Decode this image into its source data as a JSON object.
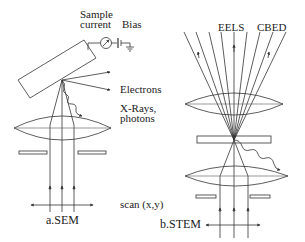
{
  "diagram": {
    "panels": [
      {
        "id": "sem",
        "caption": "a.SEM",
        "labels": {
          "sample_current": [
            "Sample",
            "current"
          ],
          "bias": "Bias",
          "electrons": "Electrons",
          "xrays": [
            "X-Rays,",
            "photons"
          ],
          "scan": "scan (x,y)"
        }
      },
      {
        "id": "stem",
        "caption": "b.STEM",
        "labels": {
          "eels": "EELS",
          "cbed": "CBED"
        }
      }
    ],
    "colors": {
      "line": "#333333",
      "text": "#222222",
      "background": "#ffffff"
    }
  }
}
